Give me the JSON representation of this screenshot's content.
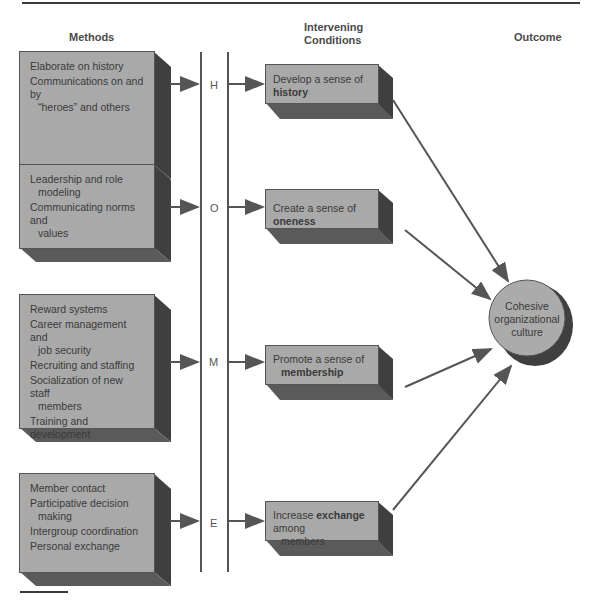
{
  "headers": {
    "methods": "Methods",
    "intervening": [
      "Intervening",
      "Conditions"
    ],
    "outcome": "Outcome"
  },
  "methods": [
    {
      "letter": "H",
      "items": [
        [
          "Elaborate on history"
        ],
        [
          "Communications on and by",
          "“heroes” and others"
        ]
      ]
    },
    {
      "letter": "O",
      "items": [
        [
          "Leadership and role",
          "modeling"
        ],
        [
          "Communicating norms and",
          "values"
        ]
      ]
    },
    {
      "letter": "M",
      "items": [
        [
          "Reward systems"
        ],
        [
          "Career management and",
          "job security"
        ],
        [
          "Recruiting and staffing"
        ],
        [
          "Socialization of new staff",
          "members"
        ],
        [
          "Training and development"
        ]
      ]
    },
    {
      "letter": "E",
      "items": [
        [
          "Member contact"
        ],
        [
          "Participative decision",
          "making"
        ],
        [
          "Intergroup coordination"
        ],
        [
          "Personal exchange"
        ]
      ]
    }
  ],
  "conditions": [
    {
      "pre": "Develop a sense of ",
      "bold": "history",
      "post": "",
      "line2": ""
    },
    {
      "pre": "Create a sense of ",
      "bold": "oneness",
      "post": "",
      "line2": ""
    },
    {
      "pre": "Promote a sense of",
      "bold": "",
      "post": "",
      "line2": "membership"
    },
    {
      "pre": "Increase ",
      "bold": "exchange",
      "post": " among",
      "line2": "members"
    }
  ],
  "outcome": [
    "Cohesive",
    "organizational",
    "culture"
  ],
  "colors": {
    "face": "#a9a9a9",
    "depth": "#555555",
    "dark": "#3a3a3a"
  }
}
